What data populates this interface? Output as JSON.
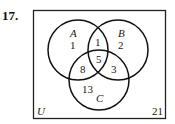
{
  "problem_number": "17.",
  "diagram": {
    "universe_label": "U",
    "universe_count": "21",
    "sets": [
      {
        "name": "A",
        "label": "A"
      },
      {
        "name": "B",
        "label": "B"
      },
      {
        "name": "C",
        "label": "C"
      }
    ],
    "regions": {
      "A_only": "1",
      "B_only": "2",
      "C_only": "13",
      "A_and_B_only": "1",
      "A_and_C_only": "8",
      "B_and_C_only": "3",
      "A_and_B_and_C": "5",
      "outside": "21"
    }
  }
}
